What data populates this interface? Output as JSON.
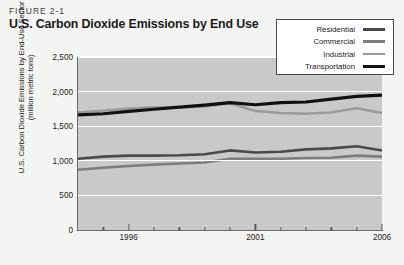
{
  "figure": {
    "label": "FIGURE 2-1",
    "title": "U.S. Carbon Dioxide Emissions by End Use"
  },
  "legend": {
    "position": "top-right",
    "entries": [
      {
        "label": "Residential",
        "color": "#4a4a4a",
        "width": 2.6
      },
      {
        "label": "Commercial",
        "color": "#7d7d7d",
        "width": 2.6
      },
      {
        "label": "Industrial",
        "color": "#9a9a9a",
        "width": 2.4
      },
      {
        "label": "Transportation",
        "color": "#111111",
        "width": 3.2
      }
    ]
  },
  "axes": {
    "ylabel_line1": "U.S. Carbon Dioxide Emissions by End-Use Sector",
    "ylabel_line2": "(million metric tons)",
    "yticks": [
      "2,500",
      "2,000",
      "1,500",
      "1,000",
      "500",
      "0"
    ],
    "xticks_major": [
      "1996",
      "2001",
      "2006"
    ]
  },
  "chart_data": {
    "type": "line",
    "title": "U.S. Carbon Dioxide Emissions by End Use",
    "xlabel": "",
    "ylabel": "U.S. Carbon Dioxide Emissions by End-Use Sector (million metric tons)",
    "xlim": [
      1994,
      2006
    ],
    "ylim": [
      0,
      2500
    ],
    "ytick_values": [
      0,
      500,
      1000,
      1500,
      2000,
      2500
    ],
    "xtick_values": [
      1996,
      2001,
      2006
    ],
    "grid": "horizontal-white",
    "legend_position": "top-right",
    "x": [
      1994,
      1995,
      1996,
      1997,
      1998,
      1999,
      2000,
      2001,
      2002,
      2003,
      2004,
      2005,
      2006
    ],
    "series": [
      {
        "name": "Transportation",
        "color": "#111111",
        "values": [
          1665,
          1680,
          1715,
          1745,
          1775,
          1805,
          1840,
          1810,
          1840,
          1850,
          1890,
          1930,
          1950
        ]
      },
      {
        "name": "Industrial",
        "color": "#9a9a9a",
        "values": [
          1700,
          1725,
          1755,
          1775,
          1770,
          1785,
          1830,
          1720,
          1690,
          1680,
          1700,
          1760,
          1690
        ]
      },
      {
        "name": "Residential",
        "color": "#4a4a4a",
        "values": [
          1030,
          1060,
          1075,
          1075,
          1080,
          1095,
          1150,
          1120,
          1130,
          1165,
          1180,
          1210,
          1150
        ]
      },
      {
        "name": "Commercial",
        "color": "#7d7d7d",
        "values": [
          870,
          900,
          925,
          945,
          960,
          975,
          1030,
          1030,
          1030,
          1040,
          1045,
          1075,
          1060
        ]
      }
    ]
  }
}
